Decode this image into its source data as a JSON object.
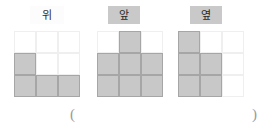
{
  "page": {
    "background_color": "#ffffff",
    "fill_color": "#c8c8c8",
    "fill_border_color": "#a6a6a6",
    "empty_border_color": "#efefef",
    "label_shade_color": "#c9c9c9"
  },
  "views": [
    {
      "id": "top-view",
      "label": "위",
      "label_shaded": false,
      "left": 14,
      "label_left": 30,
      "label_width": 34,
      "rows": 3,
      "cols": 3,
      "grid": [
        [
          0,
          0,
          0
        ],
        [
          1,
          0,
          0
        ],
        [
          1,
          1,
          1
        ]
      ]
    },
    {
      "id": "front-view",
      "label": "앞",
      "label_shaded": true,
      "left": 97,
      "label_left": 108,
      "label_width": 32,
      "rows": 3,
      "cols": 3,
      "grid": [
        [
          0,
          1,
          0
        ],
        [
          1,
          1,
          1
        ],
        [
          1,
          1,
          1
        ]
      ]
    },
    {
      "id": "side-view",
      "label": "옆",
      "label_shaded": true,
      "left": 178,
      "label_left": 190,
      "label_width": 32,
      "rows": 3,
      "cols": 3,
      "grid": [
        [
          1,
          0,
          0
        ],
        [
          1,
          1,
          0
        ],
        [
          1,
          1,
          0
        ]
      ]
    }
  ],
  "answer": {
    "open_paren": "(",
    "close_paren": ")",
    "value": ""
  }
}
